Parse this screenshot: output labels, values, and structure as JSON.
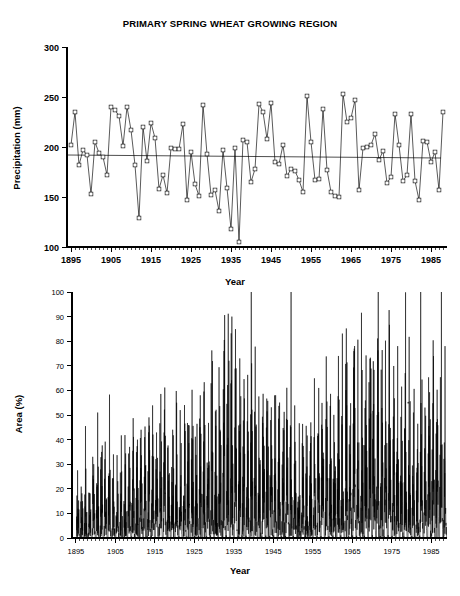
{
  "figure": {
    "title": "PRIMARY SPRING WHEAT GROWING REGION"
  },
  "panels": {
    "top": {
      "ylabel": "Precipitation (mm)",
      "xlabel": "Year"
    },
    "bottom": {
      "ylabel": "Area (%)",
      "xlabel": "Year"
    }
  },
  "chart_data": [
    {
      "type": "line",
      "id": "precipitation",
      "title": "PRIMARY SPRING WHEAT GROWING REGION",
      "xlabel": "Year",
      "ylabel": "Precipitation (mm)",
      "xlim": [
        1894,
        1989
      ],
      "ylim": [
        100,
        300
      ],
      "ytick_labels": [
        "100",
        "150",
        "200",
        "250",
        "300"
      ],
      "yticks": [
        100,
        150,
        200,
        250,
        300
      ],
      "xtick_labels": [
        "1895",
        "1905",
        "1915",
        "1925",
        "1935",
        "1945",
        "1955",
        "1965",
        "1975",
        "1985"
      ],
      "xticks": [
        1895,
        1905,
        1915,
        1925,
        1935,
        1945,
        1955,
        1965,
        1975,
        1985
      ],
      "minor_xtick_interval": 1,
      "grid": false,
      "legend": null,
      "markers": "open-square",
      "annotations": [
        {
          "label": "mean trend line",
          "type": "horizontal-trend",
          "y_start": 192,
          "y_end": 189
        }
      ],
      "x": [
        1895,
        1896,
        1897,
        1898,
        1899,
        1900,
        1901,
        1902,
        1903,
        1904,
        1905,
        1906,
        1907,
        1908,
        1909,
        1910,
        1911,
        1912,
        1913,
        1914,
        1915,
        1916,
        1917,
        1918,
        1919,
        1920,
        1921,
        1922,
        1923,
        1924,
        1925,
        1926,
        1927,
        1928,
        1929,
        1930,
        1931,
        1932,
        1933,
        1934,
        1935,
        1936,
        1937,
        1938,
        1939,
        1940,
        1941,
        1942,
        1943,
        1944,
        1945,
        1946,
        1947,
        1948,
        1949,
        1950,
        1951,
        1952,
        1953,
        1954,
        1955,
        1956,
        1957,
        1958,
        1959,
        1960,
        1961,
        1962,
        1963,
        1964,
        1965,
        1966,
        1967,
        1968,
        1969,
        1970,
        1971,
        1972,
        1973,
        1974,
        1975,
        1976,
        1977,
        1978,
        1979,
        1980,
        1981,
        1982,
        1983,
        1984,
        1985,
        1986,
        1987,
        1988
      ],
      "values": [
        202,
        235,
        182,
        197,
        192,
        153,
        205,
        194,
        190,
        172,
        240,
        237,
        231,
        201,
        240,
        217,
        182,
        129,
        220,
        186,
        224,
        209,
        158,
        172,
        154,
        199,
        198,
        198,
        223,
        147,
        195,
        163,
        151,
        242,
        193,
        152,
        157,
        136,
        197,
        159,
        118,
        199,
        105,
        207,
        205,
        165,
        178,
        243,
        235,
        208,
        244,
        185,
        183,
        202,
        171,
        178,
        176,
        167,
        155,
        251,
        205,
        167,
        168,
        238,
        177,
        155,
        151,
        150,
        253,
        225,
        229,
        247,
        157,
        199,
        200,
        202,
        213,
        187,
        196,
        164,
        170,
        233,
        202,
        166,
        172,
        233,
        166,
        147,
        206,
        205,
        185,
        195,
        157,
        235,
        183,
        123,
        147
      ],
      "value_note": "Annual precipitation, mm, read from open-square markers",
      "trend_note": "Near-flat regression line at approximately 190 mm"
    },
    {
      "type": "line",
      "id": "area-affected",
      "title": "",
      "xlabel": "Year",
      "ylabel": "Area (%)",
      "xlim": [
        1894,
        1989
      ],
      "ylim": [
        0,
        100
      ],
      "ytick_labels": [
        "0",
        "10",
        "20",
        "30",
        "40",
        "50",
        "60",
        "70",
        "80",
        "90",
        "100"
      ],
      "yticks": [
        0,
        10,
        20,
        30,
        40,
        50,
        60,
        70,
        80,
        90,
        100
      ],
      "xtick_labels": [
        "1895",
        "1905",
        "1915",
        "1925",
        "1935",
        "1945",
        "1955",
        "1965",
        "1975",
        "1985"
      ],
      "xticks": [
        1895,
        1905,
        1915,
        1925,
        1935,
        1945,
        1955,
        1965,
        1975,
        1985
      ],
      "minor_xtick_interval": 1,
      "grid": false,
      "legend": null,
      "markers": "none",
      "sampling": "sub-annual (approximately monthly)",
      "series_note": "Percent of region in drought; spiky high-frequency trace with peak near 90% in 1934-1936",
      "peaks": [
        {
          "year": 1900,
          "value": 51
        },
        {
          "year": 1901,
          "value": 35
        },
        {
          "year": 1904,
          "value": 34
        },
        {
          "year": 1911,
          "value": 44
        },
        {
          "year": 1920,
          "value": 55
        },
        {
          "year": 1926,
          "value": 58
        },
        {
          "year": 1932,
          "value": 76
        },
        {
          "year": 1934,
          "value": 90
        },
        {
          "year": 1936,
          "value": 73
        },
        {
          "year": 1939,
          "value": 71
        },
        {
          "year": 1954,
          "value": 47
        },
        {
          "year": 1956,
          "value": 61
        },
        {
          "year": 1961,
          "value": 74
        },
        {
          "year": 1976,
          "value": 78
        },
        {
          "year": 1980,
          "value": 51
        },
        {
          "year": 1988,
          "value": 78
        }
      ]
    }
  ]
}
